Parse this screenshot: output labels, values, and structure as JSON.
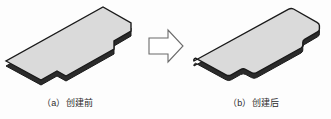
{
  "figure": {
    "title": "",
    "background_color": "#fdfdfd",
    "panels": [
      {
        "id": "panel-a",
        "caption": "（a）创建前",
        "label": "a",
        "description": "创建前",
        "shape_name": "notched-plate-sharp-corners",
        "corner_style": "sharp",
        "fill_color": "#d8d8d8",
        "top_face_color": "#dcdcdc",
        "edge_color": "#1a1a1a",
        "side_face_color": "#2a2a2a"
      },
      {
        "id": "panel-b",
        "caption": "（b）创建后",
        "label": "b",
        "description": "创建后",
        "shape_name": "notched-plate-filleted-corners",
        "corner_style": "filleted",
        "fill_color": "#d8d8d8",
        "top_face_color": "#dcdcdc",
        "edge_color": "#1a1a1a",
        "side_face_color": "#2a2a2a"
      }
    ],
    "arrow": {
      "name": "transformation-arrow",
      "direction": "right",
      "style": "hollow-outline",
      "stroke_color": "#6b6b6b",
      "fill_color": "#ffffff"
    }
  }
}
